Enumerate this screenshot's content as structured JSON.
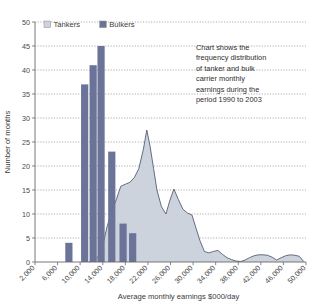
{
  "chart_data": {
    "type": "bar",
    "title": "",
    "xlabel": "Average monthly earnings $000/day",
    "ylabel": "Number of months",
    "xlim": [
      2000,
      50000
    ],
    "ylim": [
      0,
      50
    ],
    "grid": true,
    "legend_position": "top-left",
    "xticks": [
      "2,000",
      "6,000",
      "10,000",
      "14,000",
      "18,000",
      "22,000",
      "26,000",
      "30,000",
      "34,000",
      "38,000",
      "42,000",
      "46,000",
      "50,000"
    ],
    "xtick_values": [
      2000,
      6000,
      10000,
      14000,
      18000,
      22000,
      26000,
      30000,
      34000,
      38000,
      42000,
      46000,
      50000
    ],
    "yticks": [
      "0",
      "5",
      "10",
      "15",
      "20",
      "25",
      "30",
      "35",
      "40",
      "45",
      "50"
    ],
    "ytick_values": [
      0,
      5,
      10,
      15,
      20,
      25,
      30,
      35,
      40,
      45,
      50
    ],
    "series": [
      {
        "name": "Bulkers",
        "render": "bar",
        "color": "#6b7399",
        "x": [
          8000,
          10800,
          12300,
          13700,
          15600,
          17600,
          19300
        ],
        "values": [
          4,
          37,
          41,
          45,
          23,
          8,
          6
        ]
      },
      {
        "name": "Tankers",
        "render": "area",
        "color": "#ccd3dd",
        "line_color": "#555f73",
        "x": [
          11600,
          12400,
          13200,
          14000,
          14800,
          15600,
          16400,
          17200,
          18000,
          18800,
          19600,
          20400,
          21200,
          21800,
          22400,
          23000,
          23600,
          24400,
          25200,
          25800,
          26600,
          27400,
          28200,
          29000,
          29800,
          30400,
          31200,
          32000,
          32800,
          33600,
          34400,
          35200,
          36000,
          36800,
          37600,
          38400,
          39200,
          40000,
          40800,
          41600,
          42400,
          43200,
          44000,
          44800,
          45600,
          46400,
          47200,
          48000,
          48800,
          49600
        ],
        "values": [
          0,
          0.3,
          1.2,
          3.5,
          7.5,
          10.5,
          13.0,
          15.8,
          16.2,
          16.6,
          17.6,
          19.5,
          23.5,
          27.5,
          24.0,
          19.5,
          15.0,
          11.5,
          10.0,
          12.5,
          15.2,
          13.0,
          11.0,
          10.2,
          9.8,
          7.5,
          4.5,
          2.2,
          1.9,
          2.2,
          2.4,
          1.6,
          0.9,
          0.5,
          0.2,
          0.1,
          0.4,
          0.9,
          1.3,
          1.5,
          1.5,
          1.4,
          1.0,
          0.4,
          0.9,
          1.3,
          1.5,
          1.4,
          1.2,
          0.1
        ]
      }
    ],
    "annotation": {
      "lines": [
        "Chart shows the",
        "frequency distribution",
        "of tanker and bulk",
        "carrier monthly",
        "earnings during the",
        "period 1990 to 2003"
      ]
    }
  },
  "legend": {
    "items": [
      {
        "label": "Tankers",
        "color": "#ccd3dd"
      },
      {
        "label": "Bulkers",
        "color": "#6b7399"
      }
    ]
  }
}
